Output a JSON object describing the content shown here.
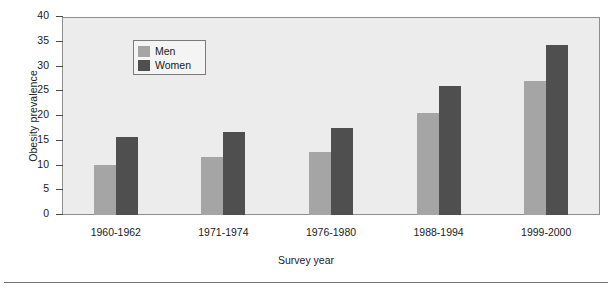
{
  "chart_data": {
    "type": "bar",
    "title": "",
    "xlabel": "Survey year",
    "ylabel": "Obesity prevalence",
    "categories": [
      "1960-1962",
      "1971-1974",
      "1976-1980",
      "1988-1994",
      "1999-2000"
    ],
    "series": [
      {
        "name": "Men",
        "color": "#a5a5a5",
        "values": [
          10.2,
          11.8,
          12.7,
          20.6,
          27.0
        ]
      },
      {
        "name": "Women",
        "color": "#4f4f4f",
        "values": [
          15.7,
          16.7,
          17.5,
          26.0,
          34.4
        ]
      }
    ],
    "ylim": [
      0,
      40
    ],
    "ytick_values": [
      0,
      5,
      10,
      15,
      20,
      25,
      30,
      35,
      40
    ],
    "ytick_labels": [
      "0",
      "5",
      "10",
      "15",
      "20",
      "25",
      "30",
      "35",
      "40"
    ],
    "grid": false,
    "legend_position": "upper left inside",
    "plot_background": "#ececec",
    "frame_color": "#8d8d8d"
  },
  "figure": {
    "bottom_rule": true
  }
}
